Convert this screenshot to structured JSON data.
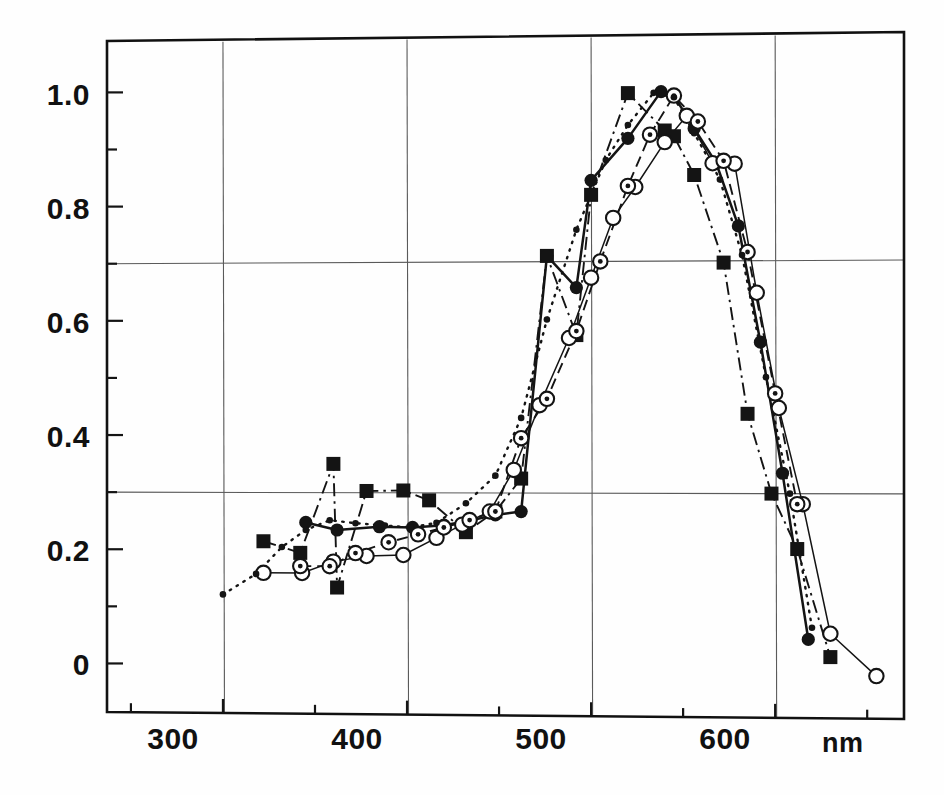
{
  "figure": {
    "background": "#fefefe",
    "ink": "#141414",
    "gridline_color": "#5a5a5a",
    "frame_color": "#111111"
  },
  "axes": {
    "x_unit_label": "nm",
    "x_tick_labels": [
      "300",
      "400",
      "500",
      "600"
    ],
    "x_tick_values": [
      300,
      400,
      500,
      600
    ],
    "x_minor_tick_values": [
      250,
      350,
      450,
      550,
      650
    ],
    "y_tick_labels": [
      "0",
      "0.2",
      "0.4",
      "0.6",
      "0.8",
      "1.0"
    ],
    "y_tick_values": [
      0,
      0.2,
      0.4,
      0.6,
      0.8,
      1.0
    ],
    "y_minor_tick_values": [
      0.1,
      0.3,
      0.5,
      0.7,
      0.9
    ],
    "xlim": [
      237,
      670
    ],
    "ylim": [
      -0.085,
      1.09
    ],
    "gridlines_x": [
      300,
      400,
      500,
      600
    ],
    "gridlines_y": [
      0.3,
      0.7
    ]
  },
  "chart_data": {
    "type": "line",
    "title": "",
    "subtitle": "",
    "xlabel": "nm",
    "ylabel": "",
    "xlim": [
      237,
      670
    ],
    "ylim": [
      -0.085,
      1.09
    ],
    "grid": true,
    "legend": "none",
    "legend_position": "none",
    "annotations": [],
    "series": [
      {
        "name": "filled-square",
        "marker": "filled-square",
        "linestyle": "dash-dot",
        "color": "#141414",
        "x": [
          322,
          342,
          360,
          362,
          378,
          398,
          412,
          432,
          448,
          462,
          476,
          492,
          500,
          520,
          540,
          545,
          556,
          572,
          585,
          598,
          612,
          630
        ],
        "y": [
          0.215,
          0.195,
          0.35,
          0.135,
          0.303,
          0.304,
          0.287,
          0.232,
          0.268,
          0.325,
          0.71,
          0.573,
          0.815,
          0.99,
          0.925,
          0.915,
          0.848,
          0.697,
          0.437,
          0.3,
          0.205,
          0.02
        ]
      },
      {
        "name": "filled-circle",
        "marker": "filled-circle",
        "linestyle": "solid",
        "color": "#141414",
        "x": [
          345,
          362,
          385,
          403,
          420,
          434,
          448,
          462,
          476,
          492,
          500,
          520,
          538,
          545,
          556,
          568,
          580,
          592,
          604,
          618
        ],
        "y": [
          0.248,
          0.235,
          0.241,
          0.24,
          0.244,
          0.252,
          0.262,
          0.268,
          0.71,
          0.655,
          0.84,
          0.912,
          0.992,
          0.985,
          0.928,
          0.868,
          0.76,
          0.56,
          0.335,
          0.05
        ]
      },
      {
        "name": "open-circle",
        "marker": "open-circle",
        "linestyle": "thin-solid",
        "color": "#141414",
        "x": [
          322,
          343,
          360,
          378,
          398,
          416,
          430,
          445,
          458,
          472,
          488,
          500,
          512,
          524,
          540,
          552,
          566,
          578,
          590,
          602,
          615,
          630,
          655
        ],
        "y": [
          0.16,
          0.16,
          0.18,
          0.19,
          0.192,
          0.222,
          0.245,
          0.268,
          0.34,
          0.452,
          0.568,
          0.672,
          0.775,
          0.828,
          0.905,
          0.95,
          0.868,
          0.867,
          0.645,
          0.447,
          0.282,
          0.06,
          -0.012
        ]
      },
      {
        "name": "dotted-circle",
        "marker": "dotted-circle",
        "linestyle": "dashed",
        "color": "#141414",
        "x": [
          342,
          358,
          372,
          390,
          406,
          420,
          434,
          448,
          462,
          476,
          492,
          505,
          520,
          532,
          545,
          558,
          572,
          585,
          600,
          612
        ],
        "y": [
          0.172,
          0.172,
          0.195,
          0.214,
          0.228,
          0.24,
          0.253,
          0.268,
          0.395,
          0.463,
          0.58,
          0.7,
          0.83,
          0.918,
          0.985,
          0.94,
          0.872,
          0.715,
          0.472,
          0.282
        ]
      },
      {
        "name": "small-dot",
        "marker": "small-dot",
        "linestyle": "dotted",
        "color": "#141414",
        "x": [
          300,
          318,
          332,
          345,
          358,
          372,
          388,
          402,
          416,
          432,
          448,
          462,
          476,
          492,
          508,
          520,
          534,
          545,
          556,
          570,
          582,
          595,
          608,
          620
        ],
        "y": [
          0.122,
          0.158,
          0.205,
          0.235,
          0.252,
          0.247,
          0.243,
          0.24,
          0.248,
          0.282,
          0.33,
          0.43,
          0.6,
          0.755,
          0.875,
          0.935,
          0.99,
          0.982,
          0.92,
          0.84,
          0.71,
          0.5,
          0.3,
          0.07
        ]
      }
    ]
  }
}
